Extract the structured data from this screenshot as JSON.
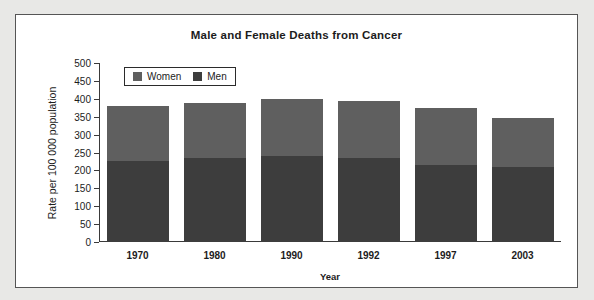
{
  "chart_data": {
    "type": "bar",
    "subtype": "stacked",
    "title": "Male and Female Deaths from Cancer",
    "xlabel": "Year",
    "ylabel": "Rate per 100 000 population",
    "categories": [
      "1970",
      "1980",
      "1990",
      "1992",
      "1997",
      "2003"
    ],
    "series": [
      {
        "name": "Men",
        "color": "#3d3d3d",
        "values": [
          225,
          235,
          240,
          235,
          215,
          210
        ]
      },
      {
        "name": "Women",
        "color": "#5f5f5f",
        "values": [
          155,
          152,
          160,
          158,
          158,
          137
        ]
      }
    ],
    "totals": [
      380,
      387,
      400,
      393,
      373,
      347
    ],
    "ylim": [
      0,
      500
    ],
    "yticks": [
      0,
      50,
      100,
      150,
      200,
      250,
      300,
      350,
      400,
      450,
      500
    ],
    "ytick_labels": [
      "0",
      "50",
      "100",
      "150",
      "200",
      "250",
      "300",
      "350",
      "400",
      "450",
      "500"
    ],
    "grid": false,
    "legend_position": "top-left",
    "legend_entries": [
      "Women",
      "Men"
    ]
  },
  "legend": {
    "items": [
      {
        "label": "Women",
        "color": "#5f5f5f"
      },
      {
        "label": "Men",
        "color": "#3d3d3d"
      }
    ]
  },
  "colors": {
    "women": "#5f5f5f",
    "men": "#3d3d3d",
    "axis": "#3a3a3a",
    "frame": "#555555",
    "page_background": "#e8e8e6",
    "plot_background": "#ffffff"
  }
}
